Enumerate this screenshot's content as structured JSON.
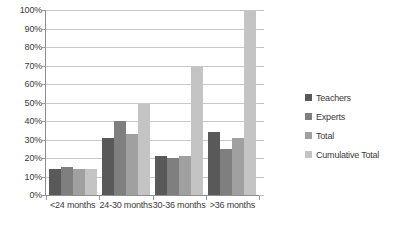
{
  "chart_data": {
    "type": "bar",
    "title": "",
    "subtitle": "",
    "xlabel": "",
    "ylabel": "",
    "categories": [
      "<24 months",
      "24-30 months",
      "30-36 months",
      ">36 months"
    ],
    "series": [
      {
        "name": "Teachers",
        "color": "#595959",
        "values": [
          14,
          31,
          21,
          34
        ]
      },
      {
        "name": "Experts",
        "color": "#7f7f7f",
        "values": [
          15,
          40,
          20,
          25
        ]
      },
      {
        "name": "Total",
        "color": "#a0a0a0",
        "values": [
          14,
          33,
          21,
          31
        ]
      },
      {
        "name": "Cumulative Total",
        "color": "#c4c4c4",
        "values": [
          14,
          49,
          70,
          100
        ]
      }
    ],
    "ylim": [
      0,
      100
    ],
    "y_tick_labels": [
      "100%",
      "90%",
      "80%",
      "70%",
      "60%",
      "50%",
      "40%",
      "30%",
      "20%",
      "10%",
      "0%"
    ],
    "y_tick_values": [
      100,
      90,
      80,
      70,
      60,
      50,
      40,
      30,
      20,
      10,
      0
    ],
    "grid": true,
    "legend_position": "right",
    "value_suffix": "%"
  },
  "colors": {
    "gridline": "#c8c8c8",
    "axis": "#8e8e8e",
    "text": "#3a3a3a",
    "background": "#ffffff"
  }
}
